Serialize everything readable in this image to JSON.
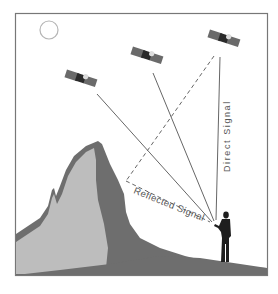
{
  "diagram": {
    "labels": {
      "direct_signal": "Direct Signal",
      "reflected_signal": "Reflected Signal"
    },
    "elements": {
      "sun": "sun-icon",
      "satellites": [
        "satellite-1",
        "satellite-2",
        "satellite-3"
      ],
      "mountain": "mountain",
      "receiver": "person-with-receiver"
    },
    "colors": {
      "frame": "#777777",
      "mountain_dark": "#6e6e6e",
      "mountain_light": "#bdbdbd",
      "ground": "#6e6e6e",
      "signal_line": "#555555",
      "satellite_panel": "#6a6a6a",
      "satellite_body": "#2a2a2a",
      "person": "#1e1e1e",
      "sun_stroke": "#b5b5b5",
      "text": "#555555"
    }
  }
}
